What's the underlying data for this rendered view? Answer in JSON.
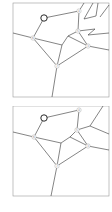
{
  "panels": [
    {
      "id": "top",
      "frame": {
        "x": 13,
        "y": 3,
        "w": 96,
        "h": 94
      },
      "special_node": {
        "x": 44,
        "y": 18
      },
      "nodes": [
        {
          "label": "4",
          "x": 79,
          "y": 11
        },
        {
          "label": "6",
          "x": 33,
          "y": 38
        },
        {
          "label": "5",
          "x": 78,
          "y": 31
        },
        {
          "label": "3",
          "x": 88,
          "y": 46
        },
        {
          "label": "7",
          "x": 57,
          "y": 66
        }
      ]
    },
    {
      "id": "bottom",
      "frame": {
        "x": 13,
        "y": 3,
        "w": 96,
        "h": 87
      },
      "special_node": {
        "x": 44,
        "y": 12
      },
      "nodes": [
        {
          "label": "4",
          "x": 79,
          "y": 4
        },
        {
          "label": "6",
          "x": 34,
          "y": 31
        },
        {
          "label": "5",
          "x": 77,
          "y": 24
        },
        {
          "label": "3",
          "x": 88,
          "y": 40
        },
        {
          "label": "7",
          "x": 57,
          "y": 60
        }
      ]
    }
  ],
  "colors": {
    "line": "#333333",
    "frame": "#999999",
    "node_fill": "#ffffff",
    "node_stroke": "#aaaaaa",
    "special_stroke": "#111111"
  }
}
